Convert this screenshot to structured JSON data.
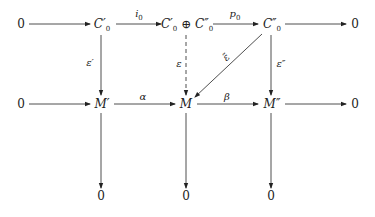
{
  "diagram": {
    "nodes": {
      "top_left_zero": "0",
      "c0_prime": "C′",
      "c0_prime_sub": "0",
      "direct_sum_a": "C′",
      "direct_sum_a_sub": "0",
      "direct_sum_op": " ⊕ ",
      "direct_sum_b": "C″",
      "direct_sum_b_sub": "0",
      "c0_double_prime": "C″",
      "c0_double_prime_sub": "0",
      "top_right_zero": "0",
      "mid_left_zero": "0",
      "m_prime": "M′",
      "m": "M",
      "m_double_prime": "M″",
      "mid_right_zero": "0",
      "bottom_zero_1": "0",
      "bottom_zero_2": "0",
      "bottom_zero_3": "0"
    },
    "labels": {
      "i0": "i",
      "i0_sub": "0",
      "p0": "p",
      "p0_sub": "0",
      "epsilon_prime": "ε′",
      "epsilon": "ε",
      "epsilon_tilde": "ε̃",
      "epsilon_double_prime": "ε″",
      "alpha": "α",
      "beta": "β"
    },
    "edges": [
      {
        "from": "0",
        "to": "C'_0",
        "label": ""
      },
      {
        "from": "C'_0",
        "to": "C'_0 ⊕ C''_0",
        "label": "i_0"
      },
      {
        "from": "C'_0 ⊕ C''_0",
        "to": "C''_0",
        "label": "p_0"
      },
      {
        "from": "C''_0",
        "to": "0",
        "label": ""
      },
      {
        "from": "C'_0",
        "to": "M'",
        "label": "ε'"
      },
      {
        "from": "C'_0 ⊕ C''_0",
        "to": "M",
        "label": "ε",
        "style": "dashed"
      },
      {
        "from": "C''_0",
        "to": "M",
        "label": "ε̃",
        "style": "diagonal"
      },
      {
        "from": "C''_0",
        "to": "M''",
        "label": "ε''"
      },
      {
        "from": "0",
        "to": "M'",
        "label": ""
      },
      {
        "from": "M'",
        "to": "M",
        "label": "α"
      },
      {
        "from": "M",
        "to": "M''",
        "label": "β"
      },
      {
        "from": "M''",
        "to": "0",
        "label": ""
      },
      {
        "from": "M'",
        "to": "0",
        "label": ""
      },
      {
        "from": "M",
        "to": "0",
        "label": ""
      },
      {
        "from": "M''",
        "to": "0",
        "label": ""
      }
    ]
  }
}
